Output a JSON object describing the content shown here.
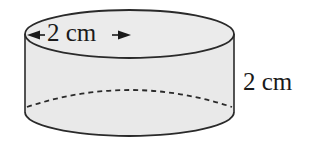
{
  "figure": {
    "shape": "cylinder",
    "fill_color": "#e9e9e9",
    "stroke_color": "#2a2a2a",
    "labels": {
      "diameter": "2 cm",
      "height": "2 cm"
    },
    "annotations": {
      "diameter_arrow": "double-headed arrow across top face",
      "hidden_edge": "dashed back edge of base"
    }
  }
}
